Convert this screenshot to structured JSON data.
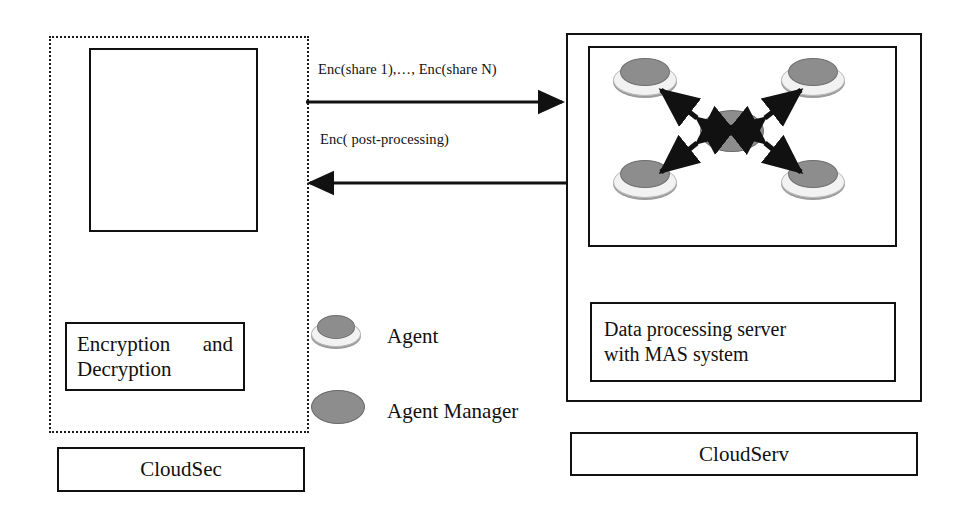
{
  "diagram": {
    "left_panel": {
      "container_name": "CloudSec boundary",
      "empty_box_label": "",
      "crypto_box": {
        "line1": "Encryption and",
        "line2": "Decryption"
      },
      "caption": "CloudSec"
    },
    "right_panel": {
      "container_name": "CloudServ boundary",
      "mas_box_label": "",
      "server_box": {
        "line1": "Data processing server",
        "line2": "with MAS system"
      },
      "caption": "CloudServ"
    },
    "arrows": {
      "to_server_label": "Enc(share 1),…, Enc(share N)",
      "to_client_label": "Enc( post-processing)"
    },
    "legend": [
      {
        "icon": "agent-icon",
        "label": "Agent"
      },
      {
        "icon": "agent-manager-icon",
        "label": "Agent Manager"
      }
    ],
    "mas_nodes": {
      "manager": "Agent Manager",
      "agents": [
        "Agent",
        "Agent",
        "Agent",
        "Agent"
      ],
      "link_count": 4,
      "link_direction": "bidirectional"
    },
    "colors": {
      "stroke": "#111111",
      "agent_top": "#8d8d8d",
      "agent_base": "#f2f2f2",
      "manager": "#8d8d8d",
      "background": "#ffffff"
    }
  }
}
